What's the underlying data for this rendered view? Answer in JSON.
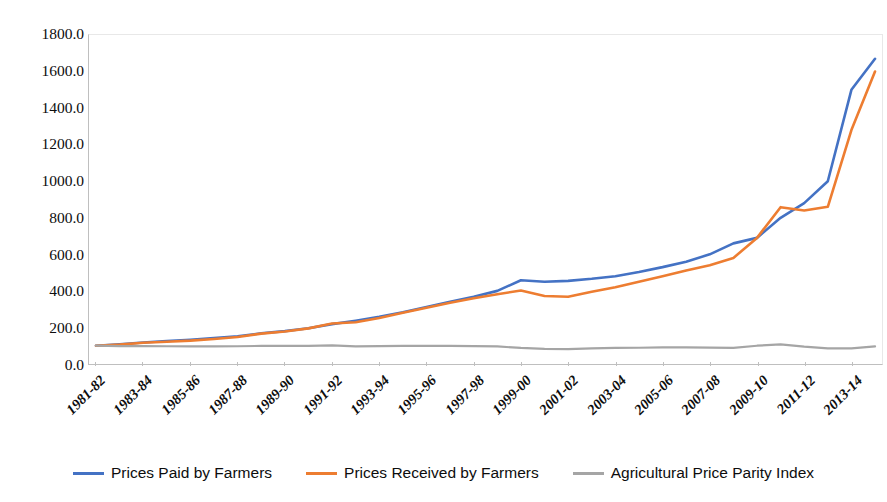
{
  "chart_data": {
    "type": "line",
    "title": "",
    "subtitle": "",
    "xlabel": "",
    "ylabel": "",
    "ylim": [
      0,
      1800
    ],
    "ytick_step": 200,
    "grid": false,
    "legend_position": "bottom",
    "x": [
      "1981-82",
      "1982-83",
      "1983-84",
      "1984-85",
      "1985-86",
      "1986-87",
      "1987-88",
      "1988-89",
      "1989-90",
      "1990-91",
      "1991-92",
      "1992-93",
      "1993-94",
      "1994-95",
      "1995-96",
      "1996-97",
      "1997-98",
      "1998-99",
      "1999-00",
      "2000-01",
      "2001-02",
      "2002-03",
      "2003-04",
      "2004-05",
      "2005-06",
      "2006-07",
      "2007-08",
      "2008-09",
      "2009-10",
      "2010-11",
      "2011-12",
      "2012-13",
      "2013-14",
      "2014-15"
    ],
    "xtick_labels": [
      "1981-82",
      "1983-84",
      "1985-86",
      "1987-88",
      "1989-90",
      "1991-92",
      "1993-94",
      "1995-96",
      "1997-98",
      "1999-00",
      "2001-02",
      "2003-04",
      "2005-06",
      "2007-08",
      "2009-10",
      "2011-12",
      "2013-14"
    ],
    "ytick_labels": [
      "1800.0",
      "1600.0",
      "1400.0",
      "1200.0",
      "1000.0",
      "800.0",
      "600.0",
      "400.0",
      "200.0",
      "0.0"
    ],
    "series": [
      {
        "name": "Prices Paid by Farmers",
        "color": "#4472C4",
        "values": [
          100,
          108,
          118,
          126,
          133,
          142,
          152,
          168,
          180,
          196,
          218,
          237,
          258,
          283,
          312,
          340,
          368,
          400,
          458,
          450,
          455,
          466,
          480,
          503,
          530,
          560,
          600,
          660,
          690,
          800,
          880,
          1000,
          1500,
          1670
        ]
      },
      {
        "name": "Prices Received by Farmers",
        "color": "#ED7D31",
        "values": [
          100,
          106,
          116,
          122,
          128,
          137,
          148,
          166,
          178,
          195,
          222,
          228,
          252,
          280,
          308,
          335,
          360,
          382,
          402,
          372,
          368,
          395,
          420,
          450,
          480,
          512,
          540,
          580,
          690,
          858,
          840,
          860,
          1280,
          1600
        ]
      },
      {
        "name": "Agricultural Price Parity Index",
        "color": "#A5A5A5",
        "values": [
          100,
          98,
          98,
          97,
          96,
          96,
          97,
          99,
          99,
          99,
          102,
          96,
          98,
          99,
          99,
          99,
          98,
          96,
          88,
          83,
          81,
          85,
          88,
          89,
          91,
          91,
          90,
          88,
          100,
          107,
          95,
          86,
          85,
          96
        ]
      }
    ]
  },
  "legend": {
    "items": [
      {
        "label": "Prices Paid by Farmers",
        "color": "#4472C4"
      },
      {
        "label": "Prices Received by Farmers",
        "color": "#ED7D31"
      },
      {
        "label": "Agricultural Price Parity Index",
        "color": "#A5A5A5"
      }
    ]
  }
}
